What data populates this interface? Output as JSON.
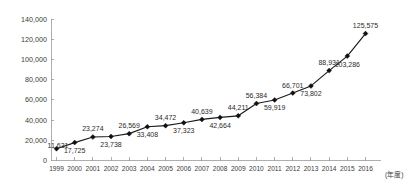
{
  "chart_data": {
    "type": "line",
    "title": "",
    "subtitle": "",
    "xlabel": "(年度)",
    "ylabel": "",
    "grid": false,
    "legend": "none",
    "xlim": [
      1999,
      2016
    ],
    "ylim": [
      0,
      140000
    ],
    "ytick_labels": [
      "140,000",
      "120,000",
      "100,000",
      "80,000",
      "60,000",
      "40,000",
      "20,000",
      "0"
    ],
    "ytick_values": [
      140000,
      120000,
      100000,
      80000,
      60000,
      40000,
      20000,
      0
    ],
    "categories": [
      "1999",
      "2000",
      "2001",
      "2002",
      "2003",
      "2004",
      "2005",
      "2006",
      "2007",
      "2008",
      "2009",
      "2010",
      "2011",
      "2012",
      "2013",
      "2014",
      "2015",
      "2016"
    ],
    "values": [
      11631,
      17725,
      23274,
      23738,
      26569,
      33408,
      34472,
      37323,
      40639,
      42664,
      44211,
      56384,
      59919,
      66701,
      73802,
      88931,
      103286,
      125575
    ],
    "point_labels": [
      "11,631",
      "17,725",
      "23,274",
      "23,738",
      "26,569",
      "33,408",
      "34,472",
      "37,323",
      "40,639",
      "42,664",
      "44,211",
      "56,384",
      "59,919",
      "66,701",
      "73,802",
      "88,931",
      "103,286",
      "125,575"
    ],
    "label_positions": [
      "left",
      "below",
      "above",
      "below",
      "above",
      "below",
      "above",
      "below",
      "above",
      "below",
      "above",
      "above",
      "below",
      "above",
      "below",
      "above",
      "below",
      "above"
    ],
    "marker": "diamond",
    "colors": {
      "line": "#1a1a1a",
      "marker": "#111111",
      "axis": "#9a9a9a",
      "text": "#3b3b3b",
      "background": "#ffffff"
    }
  }
}
